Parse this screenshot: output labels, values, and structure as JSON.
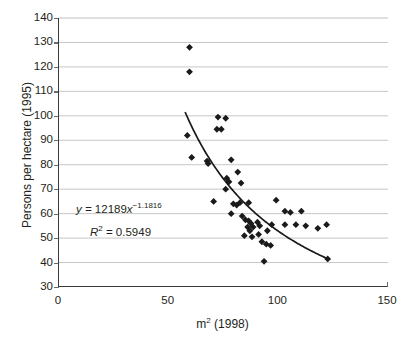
{
  "chart_data": {
    "type": "scatter",
    "title": "",
    "xlabel": "m² (1998)",
    "ylabel": "Persons per hectare (1995)",
    "xlim": [
      0,
      150
    ],
    "ylim": [
      30,
      140
    ],
    "xticks": [
      0,
      50,
      100,
      150
    ],
    "yticks": [
      30,
      40,
      50,
      60,
      70,
      80,
      90,
      100,
      110,
      120,
      130,
      140
    ],
    "grid": "horizontal",
    "legend": "none",
    "marker": "diamond",
    "marker_color": "#1a1a1a",
    "gridline_color": "#bfbfbf",
    "axis_color": "#3a3a3a",
    "points": [
      {
        "x": 59.5,
        "y": 128.0
      },
      {
        "x": 59.5,
        "y": 118.0
      },
      {
        "x": 58.5,
        "y": 92.0
      },
      {
        "x": 60.5,
        "y": 83.0
      },
      {
        "x": 72.5,
        "y": 99.5
      },
      {
        "x": 76.0,
        "y": 99.0
      },
      {
        "x": 72.0,
        "y": 94.5
      },
      {
        "x": 74.0,
        "y": 94.5
      },
      {
        "x": 67.5,
        "y": 81.5
      },
      {
        "x": 68.0,
        "y": 80.5
      },
      {
        "x": 78.5,
        "y": 82.0
      },
      {
        "x": 76.5,
        "y": 74.5
      },
      {
        "x": 77.5,
        "y": 73.0
      },
      {
        "x": 76.0,
        "y": 70.0
      },
      {
        "x": 81.5,
        "y": 77.0
      },
      {
        "x": 83.0,
        "y": 72.5
      },
      {
        "x": 70.5,
        "y": 65.0
      },
      {
        "x": 79.5,
        "y": 64.0
      },
      {
        "x": 81.0,
        "y": 63.5
      },
      {
        "x": 82.5,
        "y": 64.5
      },
      {
        "x": 86.5,
        "y": 64.5
      },
      {
        "x": 78.5,
        "y": 60.0
      },
      {
        "x": 83.5,
        "y": 59.0
      },
      {
        "x": 85.0,
        "y": 57.5
      },
      {
        "x": 86.5,
        "y": 57.0
      },
      {
        "x": 87.5,
        "y": 56.0
      },
      {
        "x": 86.0,
        "y": 54.5
      },
      {
        "x": 87.0,
        "y": 53.0
      },
      {
        "x": 88.5,
        "y": 54.5
      },
      {
        "x": 90.5,
        "y": 56.5
      },
      {
        "x": 91.5,
        "y": 55.0
      },
      {
        "x": 84.5,
        "y": 51.0
      },
      {
        "x": 88.0,
        "y": 50.5
      },
      {
        "x": 91.0,
        "y": 51.5
      },
      {
        "x": 92.5,
        "y": 48.5
      },
      {
        "x": 94.5,
        "y": 47.5
      },
      {
        "x": 96.5,
        "y": 47.0
      },
      {
        "x": 95.0,
        "y": 53.0
      },
      {
        "x": 97.0,
        "y": 55.5
      },
      {
        "x": 93.5,
        "y": 40.5
      },
      {
        "x": 99.0,
        "y": 65.5
      },
      {
        "x": 103.0,
        "y": 61.0
      },
      {
        "x": 105.5,
        "y": 60.5
      },
      {
        "x": 103.0,
        "y": 55.5
      },
      {
        "x": 108.0,
        "y": 55.5
      },
      {
        "x": 110.5,
        "y": 61.0
      },
      {
        "x": 112.5,
        "y": 55.0
      },
      {
        "x": 118.0,
        "y": 54.0
      },
      {
        "x": 122.0,
        "y": 55.5
      },
      {
        "x": 122.5,
        "y": 41.5
      }
    ],
    "trendline": {
      "type": "power",
      "coefficient": 12189,
      "exponent": -1.1816,
      "r_squared": 0.5949,
      "x_start": 57.5,
      "x_end": 122.5,
      "equation_text": "y = 12189x",
      "equation_exponent": "−1.1816",
      "r2_label": "R",
      "r2_sup": "2",
      "r2_value": "= 0.5949"
    }
  }
}
